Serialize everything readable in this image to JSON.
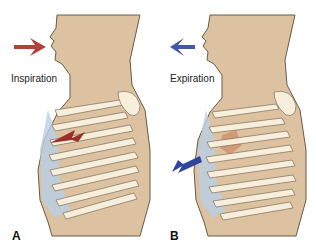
{
  "panels": [
    {
      "letter": "A",
      "label": "Inspiration",
      "arrow_color": "#b5403a"
    },
    {
      "letter": "B",
      "label": "Expiration",
      "arrow_color": "#3f58a8"
    }
  ],
  "colors": {
    "skin": "#dcc2a0",
    "outline": "#6a5a48",
    "cartilage": "#b9d0e6",
    "rib": "#f7efdc",
    "muscle": "#d39a78"
  }
}
